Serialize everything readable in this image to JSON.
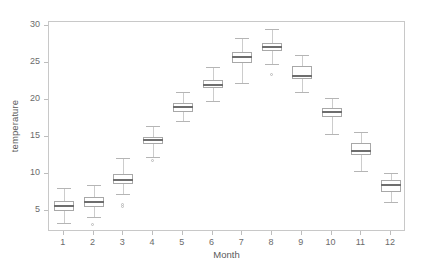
{
  "chart_data": {
    "type": "box",
    "title": "",
    "xlabel": "Month",
    "ylabel": "temperature",
    "xlim": [
      0.5,
      12.5
    ],
    "ylim": [
      2.2,
      30.6
    ],
    "ytick_labels": [
      "5",
      "10",
      "15",
      "20",
      "25",
      "30"
    ],
    "yticks": [
      5,
      10,
      15,
      20,
      25,
      30
    ],
    "xtick_labels": [
      "1",
      "2",
      "3",
      "4",
      "5",
      "6",
      "7",
      "8",
      "9",
      "10",
      "11",
      "12"
    ],
    "xticks": [
      1,
      2,
      3,
      4,
      5,
      6,
      7,
      8,
      9,
      10,
      11,
      12
    ],
    "grid": false,
    "legend": "none",
    "categories": [
      "1",
      "2",
      "3",
      "4",
      "5",
      "6",
      "7",
      "8",
      "9",
      "10",
      "11",
      "12"
    ],
    "boxes": [
      {
        "category": "1",
        "whisker_low": 3.4,
        "q1": 5.1,
        "median": 5.7,
        "q3": 6.4,
        "whisker_high": 8.2,
        "outliers": []
      },
      {
        "category": "2",
        "whisker_low": 4.2,
        "q1": 5.6,
        "median": 6.3,
        "q3": 7.0,
        "whisker_high": 8.6,
        "outliers": [
          3.1
        ]
      },
      {
        "category": "3",
        "whisker_low": 7.3,
        "q1": 8.7,
        "median": 9.3,
        "q3": 10.0,
        "whisker_high": 12.2,
        "outliers": [
          5.5,
          5.8
        ]
      },
      {
        "category": "4",
        "whisker_low": 12.4,
        "q1": 14.1,
        "median": 14.6,
        "q3": 15.1,
        "whisker_high": 16.6,
        "outliers": [
          11.7
        ]
      },
      {
        "category": "5",
        "whisker_low": 17.2,
        "q1": 18.4,
        "median": 19.1,
        "q3": 19.7,
        "whisker_high": 21.1,
        "outliers": []
      },
      {
        "category": "6",
        "whisker_low": 19.9,
        "q1": 21.7,
        "median": 22.1,
        "q3": 22.7,
        "whisker_high": 24.5,
        "outliers": []
      },
      {
        "category": "7",
        "whisker_low": 22.4,
        "q1": 25.0,
        "median": 25.8,
        "q3": 26.5,
        "whisker_high": 28.5,
        "outliers": []
      },
      {
        "category": "8",
        "whisker_low": 24.9,
        "q1": 26.7,
        "median": 27.2,
        "q3": 27.8,
        "whisker_high": 29.6,
        "outliers": [
          23.4
        ]
      },
      {
        "category": "9",
        "whisker_low": 21.1,
        "q1": 22.9,
        "median": 23.3,
        "q3": 24.7,
        "whisker_high": 26.2,
        "outliers": []
      },
      {
        "category": "10",
        "whisker_low": 15.5,
        "q1": 17.7,
        "median": 18.4,
        "q3": 19.0,
        "whisker_high": 20.3,
        "outliers": []
      },
      {
        "category": "11",
        "whisker_low": 10.4,
        "q1": 12.6,
        "median": 13.2,
        "q3": 14.2,
        "whisker_high": 15.7,
        "outliers": []
      },
      {
        "category": "12",
        "whisker_low": 6.3,
        "q1": 7.6,
        "median": 8.5,
        "q3": 9.2,
        "whisker_high": 10.2,
        "outliers": []
      }
    ]
  },
  "style": {
    "box_border": "#a8a8a8",
    "median_color": "#6e6e6e",
    "whisker_color": "#cccccc",
    "frame_color": "#c8c8c8",
    "text_color": "#5a5a5a",
    "tick_text_color": "#6b6b6b",
    "background": "#ffffff"
  }
}
